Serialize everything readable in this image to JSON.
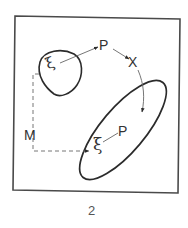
{
  "figure": {
    "caption": "2",
    "labels": {
      "p_top": "P",
      "x": "X",
      "m": "M",
      "p_bottom": "P",
      "xi_top": "ξ",
      "xi_bottom": "ξ"
    },
    "colors": {
      "stroke": "#2b2b2b",
      "frame": "#4a4a4a",
      "thin_line": "#666666",
      "background": "#ffffff"
    },
    "elements": {
      "frame": "square border",
      "small_region": "rounded blob containing ξ",
      "large_region": "tilted ellipse containing ξ and P",
      "arrow_xi_to_p": "solid arrow from ξ (small region) to P",
      "arrow_p_to_x": "solid arrow from P to X",
      "arc_x_to_ellipse": "curved arrow from X into large ellipse",
      "dashed_path_m": "dashed path labeled M from small region to ξ in large ellipse",
      "line_xi_p": "thin line connecting ξ to P in large ellipse"
    }
  }
}
